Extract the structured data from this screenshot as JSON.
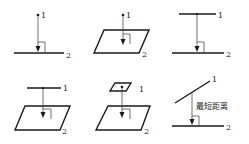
{
  "diagram": {
    "panels": [
      {
        "id": "point-to-line",
        "object1": "point",
        "object2": "line",
        "label1": "1",
        "label2": "2"
      },
      {
        "id": "point-to-plane",
        "object1": "point",
        "object2": "plane",
        "label1": "1",
        "label2": "2"
      },
      {
        "id": "line-to-line",
        "object1": "line",
        "object2": "line",
        "label1": "1",
        "label2": "2"
      },
      {
        "id": "line-to-plane",
        "object1": "line",
        "object2": "plane",
        "label1": "1",
        "label2": "2"
      },
      {
        "id": "plane-to-plane",
        "object1": "plane",
        "object2": "plane",
        "label1": "1",
        "label2": "2"
      },
      {
        "id": "skew-line-to-line",
        "object1": "oblique line",
        "object2": "line",
        "label1": "1",
        "label2": "2",
        "annotation": "最短距离"
      }
    ],
    "colors": {
      "ink": "#1a1a1a",
      "background": "#ffffff"
    }
  }
}
